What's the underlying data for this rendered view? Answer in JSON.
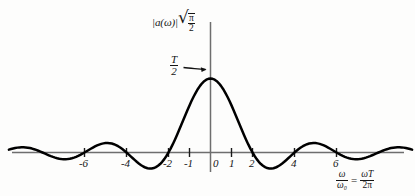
{
  "figure": {
    "kind": "math-plot",
    "background_color": "#fdfdfc",
    "curve_color": "#000000",
    "axis_color": "#6e6e6e",
    "text_color": "#141414"
  },
  "y_axis": {
    "label_magnitude": "|a(ω)|",
    "label_radical_sign": "√",
    "label_radical_numerator": "π",
    "label_radical_denominator": "2",
    "label_full": "|a(ω)|√(π/2)"
  },
  "peak_annotation": {
    "numerator": "T",
    "denominator": "2",
    "label_full": "T/2",
    "arrow": "arrow-to-peak"
  },
  "x_axis": {
    "caption_left_numerator": "ω",
    "caption_left_denominator": "ω₀",
    "caption_equals": "=",
    "caption_right_numerator": "ωT",
    "caption_right_denominator": "2π",
    "caption_full": "ω/ω₀ = ωT/2π",
    "tick_labels": [
      "-6",
      "-4",
      "-2",
      "-1",
      "0",
      "1",
      "2",
      "4",
      "6"
    ],
    "tick_values": [
      -6,
      -4,
      -2,
      -1,
      0,
      1,
      2,
      4,
      6
    ]
  },
  "chart_data": {
    "type": "line",
    "title": "",
    "xlabel": "ω/ω₀ = ωT/2π",
    "ylabel": "|a(ω)|√(π/2)",
    "xlim": [
      -9.6,
      9.6
    ],
    "ylim": [
      -0.31,
      1.05
    ],
    "grid": false,
    "legend": "none",
    "annotations": [
      {
        "text": "T/2",
        "x": 0,
        "y": 1.0,
        "kind": "peak-value-with-arrow"
      }
    ],
    "series": [
      {
        "name": "|a(ω)|√(π/2)",
        "function": "sinc(x/2) = sin(πx/2)/(πx/2)",
        "zeros": [
          -8,
          -6,
          -4,
          -2,
          2,
          4,
          6,
          8
        ],
        "x": [
          -9.6,
          -9.2,
          -8.8,
          -8.4,
          -8.0,
          -7.6,
          -7.2,
          -6.8,
          -6.4,
          -6.0,
          -5.6,
          -5.2,
          -4.8,
          -4.4,
          -4.0,
          -3.6,
          -3.2,
          -2.8,
          -2.4,
          -2.0,
          -1.6,
          -1.2,
          -0.8,
          -0.4,
          0.0,
          0.4,
          0.8,
          1.2,
          1.6,
          2.0,
          2.4,
          2.8,
          3.2,
          3.6,
          4.0,
          4.4,
          4.8,
          5.2,
          5.6,
          6.0,
          6.4,
          6.8,
          7.2,
          7.6,
          8.0,
          8.4,
          8.8,
          9.2,
          9.6
        ],
        "y": [
          0.062,
          0.065,
          0.043,
          0.0,
          -0.047,
          -0.078,
          -0.084,
          -0.063,
          -0.024,
          0.0,
          0.048,
          0.097,
          0.12,
          0.098,
          0.0,
          -0.106,
          -0.193,
          -0.216,
          -0.154,
          0.0,
          0.189,
          0.505,
          0.757,
          0.936,
          1.0,
          0.936,
          0.757,
          0.505,
          0.189,
          0.0,
          -0.154,
          -0.216,
          -0.193,
          -0.106,
          0.0,
          0.098,
          0.12,
          0.097,
          0.048,
          0.0,
          -0.024,
          -0.063,
          -0.084,
          -0.078,
          -0.047,
          0.0,
          0.043,
          0.065,
          0.062
        ],
        "peak_value_label": "T/2",
        "peak_x": 0
      }
    ]
  }
}
